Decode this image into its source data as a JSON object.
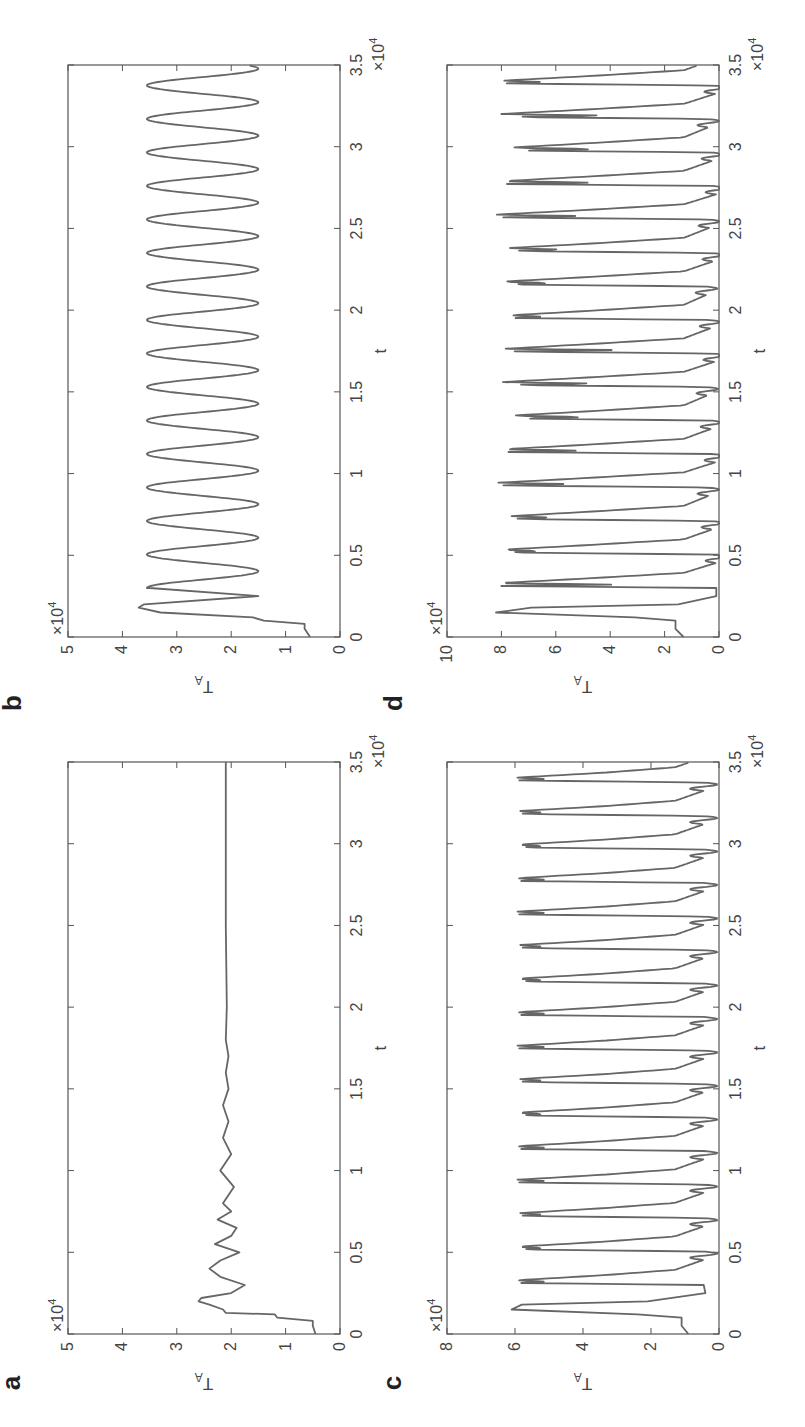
{
  "figure": {
    "orientation": "rotated -90 degrees",
    "panels": [
      "a",
      "b",
      "c",
      "d"
    ]
  },
  "chart_data": [
    {
      "panel": "a",
      "type": "line",
      "title": "",
      "xlabel": "t",
      "ylabel": "T_A",
      "x_multiplier": "×10^4",
      "y_multiplier": "×10^4",
      "xlim": [
        0,
        3.5
      ],
      "ylim": [
        0,
        5
      ],
      "xticks": [
        "0",
        "0.5",
        "1",
        "1.5",
        "2",
        "2.5",
        "3",
        "3.5"
      ],
      "yticks": [
        "0",
        "1",
        "2",
        "3",
        "4",
        "5"
      ],
      "description": "Damped oscillation converging to steady state ~2.1",
      "x": [
        0,
        0.05,
        0.08,
        0.1,
        0.12,
        0.13,
        0.15,
        0.18,
        0.2,
        0.22,
        0.25,
        0.3,
        0.35,
        0.4,
        0.45,
        0.5,
        0.55,
        0.6,
        0.65,
        0.7,
        0.75,
        0.8,
        0.9,
        1.0,
        1.1,
        1.2,
        1.3,
        1.4,
        1.5,
        1.6,
        1.7,
        1.8,
        2.0,
        2.5,
        3.0,
        3.5
      ],
      "values": [
        0.45,
        0.5,
        0.5,
        1.15,
        1.2,
        2.1,
        2.15,
        2.4,
        2.6,
        2.55,
        2.0,
        1.75,
        2.2,
        2.4,
        2.2,
        1.85,
        2.3,
        2.0,
        1.9,
        2.25,
        2.0,
        2.15,
        1.95,
        2.2,
        2.0,
        2.15,
        2.05,
        2.15,
        2.05,
        2.1,
        2.05,
        2.1,
        2.08,
        2.1,
        2.1,
        2.1
      ]
    },
    {
      "panel": "b",
      "type": "line",
      "title": "",
      "xlabel": "t",
      "ylabel": "T_A",
      "x_multiplier": "×10^4",
      "y_multiplier": "×10^4",
      "xlim": [
        0,
        3.5
      ],
      "ylim": [
        0,
        5
      ],
      "xticks": [
        "0",
        "0.5",
        "1",
        "1.5",
        "2",
        "2.5",
        "3",
        "3.5"
      ],
      "yticks": [
        "0",
        "1",
        "2",
        "3",
        "4",
        "5"
      ],
      "description": "Sustained periodic oscillation between ~1.5 and ~3.5, period ~0.2e4",
      "x": [
        0,
        0.05,
        0.08,
        0.1,
        0.12,
        0.15,
        0.18,
        0.2,
        0.25,
        0.3
      ],
      "values": [
        0.55,
        0.65,
        0.65,
        1.4,
        1.6,
        3.3,
        3.7,
        3.6,
        1.5,
        3.5
      ],
      "oscillation": {
        "min": 1.5,
        "max": 3.55,
        "period": 0.205,
        "start": 0.3
      }
    },
    {
      "panel": "c",
      "type": "line",
      "title": "",
      "xlabel": "t",
      "ylabel": "T_A",
      "x_multiplier": "×10^4",
      "y_multiplier": "×10^4",
      "xlim": [
        0,
        3.5
      ],
      "ylim": [
        0,
        8
      ],
      "xticks": [
        "0",
        "0.5",
        "1",
        "1.5",
        "2",
        "2.5",
        "3",
        "3.5"
      ],
      "yticks": [
        "0",
        "2",
        "4",
        "6",
        "8"
      ],
      "description": "Periodic bursting with double-peaks near 5.9 and troughs near 0.5, period ~0.2e4",
      "x": [
        0,
        0.05,
        0.1,
        0.12,
        0.15,
        0.18,
        0.2,
        0.25
      ],
      "values": [
        0.9,
        1.1,
        1.1,
        2.4,
        6.1,
        5.8,
        2.1,
        0.4
      ],
      "oscillation": {
        "min": 0.45,
        "max": 5.95,
        "notch": 5.1,
        "period": 0.205,
        "start": 0.3
      }
    },
    {
      "panel": "d",
      "type": "line",
      "title": "",
      "xlabel": "t",
      "ylabel": "T_A",
      "x_multiplier": "×10^4",
      "y_multiplier": "×10^4",
      "xlim": [
        0,
        3.5
      ],
      "ylim": [
        0,
        10
      ],
      "xticks": [
        "0",
        "0.5",
        "1",
        "1.5",
        "2",
        "2.5",
        "3",
        "3.5"
      ],
      "yticks": [
        "0",
        "2",
        "4",
        "6",
        "8",
        "10"
      ],
      "description": "Irregular (chaotic) bursting between ~0.2 and ~8.2",
      "x": [
        0,
        0.05,
        0.1,
        0.12,
        0.15,
        0.18,
        0.2,
        0.25
      ],
      "values": [
        1.3,
        1.6,
        1.6,
        3.1,
        8.2,
        6.9,
        1.5,
        0.1
      ],
      "oscillation": {
        "min": 0.1,
        "max": 8.2,
        "period": 0.205,
        "start": 0.3,
        "irregular": true
      }
    }
  ],
  "labels": {
    "a": "a",
    "b": "b",
    "c": "c",
    "d": "d",
    "xlabel": "t",
    "ylabel_main": "T",
    "ylabel_sub": "A",
    "multiplier": "×10",
    "multiplier_exp": "4"
  }
}
